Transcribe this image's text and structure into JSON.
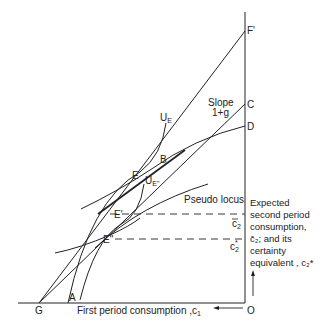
{
  "diagram": {
    "type": "economics-consumption-diagram",
    "points": {
      "F": "F'",
      "C": "C",
      "D": "D",
      "G": "G",
      "A": "A",
      "O": "O",
      "B": "B",
      "E": "E",
      "E_prime": "E'",
      "E_double_prime": "E\""
    },
    "curve_labels": {
      "U_E": "U",
      "U_E_sub": "E",
      "U_Estar": "U",
      "U_Estar_sub": "E\"",
      "pseudo_locus": "Pseudo locus"
    },
    "slope_label": {
      "line1": "Slope",
      "line2": "1+g"
    },
    "axis_labels": {
      "x": "First period consumption ,c",
      "x_sub": "1"
    },
    "tick_labels": {
      "c2_bar": "c",
      "c2_bar_sub": "2",
      "c2_star": "c",
      "c2_star_sub": "2",
      "c2_star_sup": "*"
    },
    "annotation": {
      "line1": "Expected",
      "line2": "second period",
      "line3": "consumption,",
      "line4": "c̄₂; and its",
      "line5": "certainty",
      "line6": "equivalent , c₂*"
    }
  }
}
